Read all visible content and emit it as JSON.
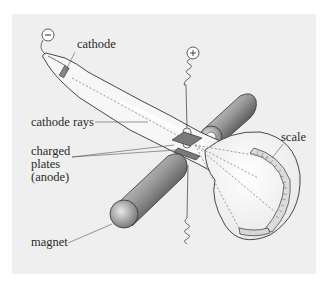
{
  "diagram": {
    "labels": {
      "cathode": "cathode",
      "cathode_rays": "cathode rays",
      "charged_plates_line1": "charged",
      "charged_plates_line2": "plates",
      "charged_plates_line3": "(anode)",
      "magnet": "magnet",
      "scale": "scale"
    },
    "terminals": {
      "negative": "−",
      "positive": "+"
    },
    "colors": {
      "background": "#efefef",
      "outline": "#333333",
      "tube_fill": "#f7f7f7",
      "ray_dots": "#9a9a9a",
      "magnet_dark": "#555555",
      "magnet_light": "#f2f2f2"
    }
  }
}
